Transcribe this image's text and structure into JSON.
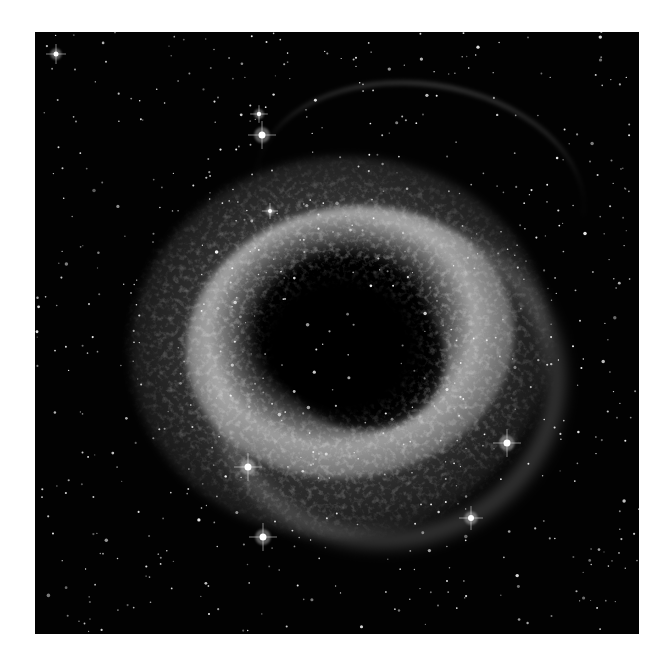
{
  "image": {
    "subject": "Helix Nebula (grayscale astronomical image)",
    "description": "Ring-shaped planetary nebula with a dark central cavity, bright textured ring, radial filaments, surrounded by a dense star field on black background",
    "colors": {
      "page_background": "#ffffff",
      "sky": "#020202",
      "nebula_bright": "#d0d0d0",
      "nebula_mid": "#8a8a8a",
      "star": "#ffffff"
    },
    "frame": {
      "left": 35,
      "top": 32,
      "width": 604,
      "height": 602
    },
    "bright_stars": [
      {
        "x": 227,
        "y": 103,
        "r": 3.5
      },
      {
        "x": 213,
        "y": 435,
        "r": 3.5
      },
      {
        "x": 472,
        "y": 411,
        "r": 3.5
      },
      {
        "x": 436,
        "y": 486,
        "r": 3
      },
      {
        "x": 228,
        "y": 505,
        "r": 3.5
      },
      {
        "x": 21,
        "y": 22,
        "r": 2.5
      },
      {
        "x": 224,
        "y": 82,
        "r": 2.2
      },
      {
        "x": 235,
        "y": 179,
        "r": 2
      }
    ]
  }
}
